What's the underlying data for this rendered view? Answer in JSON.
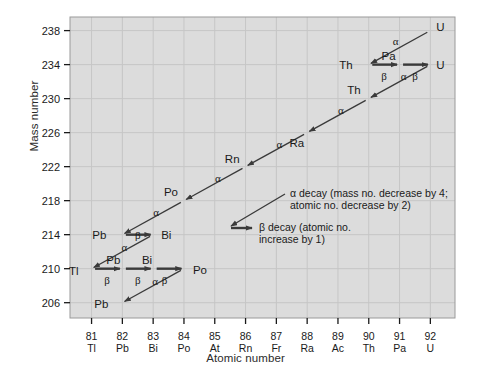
{
  "chart_data": {
    "type": "scatter",
    "title": "",
    "xlabel": "Atomic number",
    "ylabel": "Mass number",
    "xlim": [
      80.3,
      92.8
    ],
    "ylim": [
      204.2,
      239.6
    ],
    "grid": true,
    "legend_position": "inside-right",
    "x_ticks": [
      {
        "number": "81",
        "symbol": "Tl"
      },
      {
        "number": "82",
        "symbol": "Pb"
      },
      {
        "number": "83",
        "symbol": "Bi"
      },
      {
        "number": "84",
        "symbol": "Po"
      },
      {
        "number": "85",
        "symbol": "At"
      },
      {
        "number": "86",
        "symbol": "Rn"
      },
      {
        "number": "87",
        "symbol": "Fr"
      },
      {
        "number": "88",
        "symbol": "Ra"
      },
      {
        "number": "89",
        "symbol": "Ac"
      },
      {
        "number": "90",
        "symbol": "Th"
      },
      {
        "number": "91",
        "symbol": "Pa"
      },
      {
        "number": "92",
        "symbol": "U"
      }
    ],
    "y_ticks": [
      "206",
      "210",
      "214",
      "218",
      "222",
      "226",
      "230",
      "234",
      "238"
    ],
    "nodes": [
      {
        "label": "U",
        "z": 92,
        "a": 238,
        "lx": 6,
        "ly": -4
      },
      {
        "label": "Th",
        "z": 90,
        "a": 234,
        "lx": -16,
        "ly": 0
      },
      {
        "label": "Pa",
        "z": 91,
        "a": 234,
        "lx": -4,
        "ly": -9
      },
      {
        "label": "U",
        "z": 92,
        "a": 234,
        "lx": 6,
        "ly": 0
      },
      {
        "label": "Th",
        "z": 90,
        "a": 230,
        "lx": -8,
        "ly": -9
      },
      {
        "label": "Ra",
        "z": 88,
        "a": 226,
        "lx": -3,
        "ly": 10
      },
      {
        "label": "Rn",
        "z": 86,
        "a": 222,
        "lx": -6,
        "ly": -8
      },
      {
        "label": "Po",
        "z": 84,
        "a": 218,
        "lx": -6,
        "ly": -9
      },
      {
        "label": "Pb",
        "z": 82,
        "a": 214,
        "lx": -16,
        "ly": 0
      },
      {
        "label": "Bi",
        "z": 83,
        "a": 214,
        "lx": 8,
        "ly": 0
      },
      {
        "label": "Tl",
        "z": 81,
        "a": 210,
        "lx": -13,
        "ly": 2
      },
      {
        "label": "Pb",
        "z": 82,
        "a": 210,
        "lx": -2,
        "ly": -9
      },
      {
        "label": "Bi",
        "z": 83,
        "a": 210,
        "lx": -1,
        "ly": -9
      },
      {
        "label": "Po",
        "z": 84,
        "a": 210,
        "lx": 9,
        "ly": 1
      },
      {
        "label": "Pb",
        "z": 82,
        "a": 206,
        "lx": -14,
        "ly": 1
      }
    ],
    "decays": [
      {
        "from_z": 92,
        "from_a": 238,
        "to_z": 90,
        "to_a": 234,
        "type": "alpha",
        "symbol": "α",
        "lx": -4,
        "ly": -7
      },
      {
        "from_z": 90,
        "from_a": 234,
        "to_z": 91,
        "to_a": 234,
        "type": "beta",
        "symbol": "β",
        "lx": 0,
        "ly": 11
      },
      {
        "from_z": 91,
        "from_a": 234,
        "to_z": 92,
        "to_a": 234,
        "type": "beta",
        "symbol": "β",
        "lx": 0,
        "ly": 11
      },
      {
        "from_z": 92,
        "from_a": 234,
        "to_z": 90,
        "to_a": 230,
        "type": "alpha",
        "symbol": "α",
        "lx": 4,
        "ly": -6
      },
      {
        "from_z": 90,
        "from_a": 230,
        "to_z": 88,
        "to_a": 226,
        "type": "alpha",
        "symbol": "α",
        "lx": 3,
        "ly": -6
      },
      {
        "from_z": 88,
        "from_a": 226,
        "to_z": 86,
        "to_a": 222,
        "type": "alpha",
        "symbol": "α",
        "lx": 3,
        "ly": -6
      },
      {
        "from_z": 86,
        "from_a": 222,
        "to_z": 84,
        "to_a": 218,
        "type": "alpha",
        "symbol": "α",
        "lx": 3,
        "ly": -6
      },
      {
        "from_z": 84,
        "from_a": 218,
        "to_z": 82,
        "to_a": 214,
        "type": "alpha",
        "symbol": "α",
        "lx": 3,
        "ly": -6
      },
      {
        "from_z": 82,
        "from_a": 214,
        "to_z": 83,
        "to_a": 214,
        "type": "beta",
        "symbol": "β",
        "lx": 0,
        "ly": 0
      },
      {
        "from_z": 83,
        "from_a": 214,
        "to_z": 81,
        "to_a": 210,
        "type": "alpha",
        "symbol": "α",
        "lx": 2,
        "ly": -5
      },
      {
        "from_z": 81,
        "from_a": 210,
        "to_z": 82,
        "to_a": 210,
        "type": "beta",
        "symbol": "β",
        "lx": 0,
        "ly": 11
      },
      {
        "from_z": 82,
        "from_a": 210,
        "to_z": 83,
        "to_a": 210,
        "type": "beta",
        "symbol": "β",
        "lx": 0,
        "ly": 11
      },
      {
        "from_z": 83,
        "from_a": 210,
        "to_z": 84,
        "to_a": 210,
        "type": "beta",
        "symbol": "β",
        "lx": -4,
        "ly": 11
      },
      {
        "from_z": 84,
        "from_a": 210,
        "to_z": 82,
        "to_a": 206,
        "type": "alpha",
        "symbol": "α",
        "lx": 2,
        "ly": -5
      }
    ],
    "annotations": [
      {
        "name": "alpha-legend",
        "line1": "α decay (mass no. decrease by 4;",
        "line2": "atomic no. decrease by 2)"
      },
      {
        "name": "beta-legend",
        "line1": "β decay (atomic no.",
        "line2": "increase by 1)"
      }
    ],
    "colors": {
      "plot_background": "#dcdcdc",
      "gridline": "#c6c6c6",
      "arrow": "#3a3a3a",
      "axis_text": "#1a1a1a",
      "page_background": "#ffffff"
    }
  }
}
